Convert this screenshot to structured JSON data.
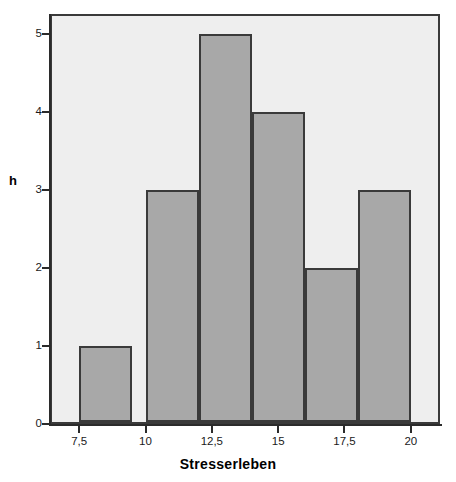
{
  "chart_data": {
    "type": "bar",
    "title": "",
    "subtitle": "",
    "xlabel": "Stresserleben",
    "ylabel": "h",
    "xlim": [
      6.4,
      21.1
    ],
    "ylim": [
      0,
      5.25
    ],
    "grid": false,
    "legend": null,
    "bin_width": 2,
    "categories": [
      "7,5–9,5",
      "10–12",
      "12–14",
      "14–16",
      "16–18",
      "18–20"
    ],
    "bin_edges": [
      7.5,
      9.5,
      10,
      12,
      14,
      16,
      18,
      20
    ],
    "bars": [
      {
        "label": "7,5–9,5",
        "x_start": 7.5,
        "x_end": 9.5,
        "value": 1
      },
      {
        "label": "10–12",
        "x_start": 10,
        "x_end": 12,
        "value": 3
      },
      {
        "label": "12–14",
        "x_start": 12,
        "x_end": 14,
        "value": 5
      },
      {
        "label": "14–16",
        "x_start": 14,
        "x_end": 16,
        "value": 4
      },
      {
        "label": "16–18",
        "x_start": 16,
        "x_end": 18,
        "value": 2
      },
      {
        "label": "18–20",
        "x_start": 18,
        "x_end": 20,
        "value": 3
      }
    ],
    "values": [
      1,
      3,
      5,
      4,
      2,
      3
    ],
    "x_ticks": [
      {
        "value": 7.5,
        "label": "7,5"
      },
      {
        "value": 10,
        "label": "10"
      },
      {
        "value": 12.5,
        "label": "12,5"
      },
      {
        "value": 15,
        "label": "15"
      },
      {
        "value": 17.5,
        "label": "17,5"
      },
      {
        "value": 20,
        "label": "20"
      }
    ],
    "y_ticks": [
      {
        "value": 0,
        "label": "0"
      },
      {
        "value": 1,
        "label": "1"
      },
      {
        "value": 2,
        "label": "2"
      },
      {
        "value": 3,
        "label": "3"
      },
      {
        "value": 4,
        "label": "4"
      },
      {
        "value": 5,
        "label": "5"
      }
    ],
    "colors": {
      "bar_fill": "#a8a8a8",
      "bar_outline": "#3a3a3a",
      "plot_background": "#eeeeee",
      "axis": "#2b2b2b",
      "text": "#000000",
      "figure_background": "#ffffff"
    }
  }
}
